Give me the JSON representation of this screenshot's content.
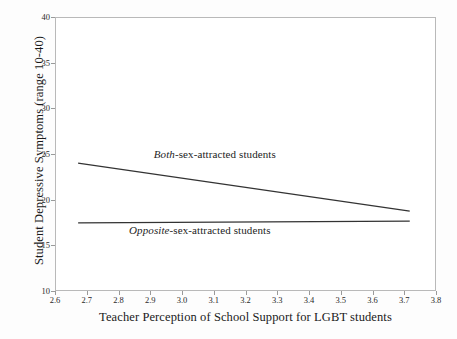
{
  "chart_data": {
    "type": "line",
    "title": "",
    "xlabel": "Teacher Perception of School Support for LGBT students",
    "ylabel": "Student Depressive Symptoms (range 10-40)",
    "xlim": [
      2.6,
      3.8
    ],
    "ylim": [
      10,
      40
    ],
    "xticks": [
      "2.6",
      "2.7",
      "2.8",
      "2.9",
      "3.0",
      "3.1",
      "3.2",
      "3.3",
      "3.4",
      "3.5",
      "3.6",
      "3.7",
      "3.8"
    ],
    "xtick_values": [
      2.6,
      2.7,
      2.8,
      2.9,
      3.0,
      3.1,
      3.2,
      3.3,
      3.4,
      3.5,
      3.6,
      3.7,
      3.8
    ],
    "yticks": [
      "10",
      "15",
      "20",
      "25",
      "30",
      "35",
      "40"
    ],
    "ytick_values": [
      10,
      15,
      20,
      25,
      30,
      35,
      40
    ],
    "grid": false,
    "legend_position": "inline-annotations",
    "series": [
      {
        "name": "Both-sex-attracted students",
        "name_emphasis": "Both",
        "name_rest": "-sex-attracted students",
        "x": [
          2.67,
          3.72
        ],
        "values": [
          24.0,
          18.7
        ],
        "color": "#333333",
        "label_x": 3.1,
        "label_y": 24.9
      },
      {
        "name": "Opposite-sex-attracted students",
        "name_emphasis": "Opposite",
        "name_rest": "-sex-attracted students",
        "x": [
          2.67,
          3.72
        ],
        "values": [
          17.4,
          17.6
        ],
        "color": "#333333",
        "label_x": 3.06,
        "label_y": 16.6
      }
    ]
  },
  "figure": {
    "background_color": "#fdfdfd",
    "plot_background_color": "#ffffff",
    "frame_color": "#b9b9b9",
    "text_color": "#1a1a1a"
  }
}
